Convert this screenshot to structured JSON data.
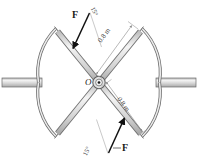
{
  "figure": {
    "background_color": "#ffffff",
    "width": 198,
    "height": 168
  },
  "center": {
    "hub_label": "O",
    "hub_name": "center-hub"
  },
  "forces": [
    {
      "label": "F",
      "angle_label": "15°",
      "position": "upper-left",
      "direction": "down-right toward center"
    },
    {
      "label": "F",
      "angle_label": "15°",
      "position": "lower-right",
      "direction": "up-left toward center"
    }
  ],
  "dimensions": [
    {
      "label": "0.8 m",
      "position": "upper-right spoke"
    },
    {
      "label": "0.8 m",
      "position": "lower-right spoke"
    }
  ],
  "colors": {
    "outline": "#5a5a5a",
    "spoke_fill": "#d8d8d8",
    "shaft_fill": "#cfcfcf",
    "arrow": "#111111",
    "dim_line": "#9a9a9a",
    "text": "#1a1a1a"
  },
  "parts": {
    "left_shaft": "left-shaft",
    "right_shaft": "right-shaft",
    "arc_top_left": "arc-top-left",
    "arc_top_right": "arc-top-right",
    "arc_bottom_left": "arc-bottom-left",
    "arc_bottom_right": "arc-bottom-right",
    "spoke_nw": "spoke-northwest",
    "spoke_ne": "spoke-northeast",
    "spoke_sw": "spoke-southwest",
    "spoke_se": "spoke-southeast"
  }
}
